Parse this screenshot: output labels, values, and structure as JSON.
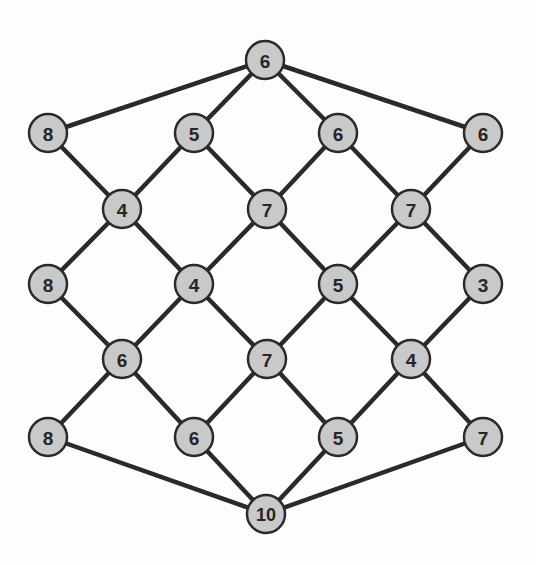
{
  "diagram": {
    "type": "lattice-graph",
    "style": {
      "node_fill": "#c9c9c9",
      "node_stroke": "#2a2a2a",
      "edge_color": "#2a2a2a",
      "background": "#fdfdfd",
      "node_radius": 19
    },
    "nodes": [
      {
        "id": "n0",
        "label": "6",
        "x": 265,
        "y": 60
      },
      {
        "id": "n1",
        "label": "8",
        "x": 48,
        "y": 133
      },
      {
        "id": "n2",
        "label": "5",
        "x": 194,
        "y": 133
      },
      {
        "id": "n3",
        "label": "6",
        "x": 338,
        "y": 133
      },
      {
        "id": "n4",
        "label": "6",
        "x": 483,
        "y": 133
      },
      {
        "id": "n5",
        "label": "4",
        "x": 122,
        "y": 209
      },
      {
        "id": "n6",
        "label": "7",
        "x": 267,
        "y": 209
      },
      {
        "id": "n7",
        "label": "7",
        "x": 411,
        "y": 209
      },
      {
        "id": "n8",
        "label": "8",
        "x": 48,
        "y": 284
      },
      {
        "id": "n9",
        "label": "4",
        "x": 194,
        "y": 284
      },
      {
        "id": "n10",
        "label": "5",
        "x": 338,
        "y": 284
      },
      {
        "id": "n11",
        "label": "3",
        "x": 483,
        "y": 284
      },
      {
        "id": "n12",
        "label": "6",
        "x": 122,
        "y": 359
      },
      {
        "id": "n13",
        "label": "7",
        "x": 267,
        "y": 359
      },
      {
        "id": "n14",
        "label": "4",
        "x": 411,
        "y": 359
      },
      {
        "id": "n15",
        "label": "8",
        "x": 48,
        "y": 437
      },
      {
        "id": "n16",
        "label": "6",
        "x": 194,
        "y": 437
      },
      {
        "id": "n17",
        "label": "5",
        "x": 338,
        "y": 437
      },
      {
        "id": "n18",
        "label": "7",
        "x": 483,
        "y": 437
      },
      {
        "id": "n19",
        "label": "10",
        "x": 266,
        "y": 514
      }
    ],
    "edges": [
      [
        "n0",
        "n1"
      ],
      [
        "n0",
        "n2"
      ],
      [
        "n0",
        "n3"
      ],
      [
        "n0",
        "n4"
      ],
      [
        "n1",
        "n5"
      ],
      [
        "n2",
        "n5"
      ],
      [
        "n2",
        "n6"
      ],
      [
        "n3",
        "n6"
      ],
      [
        "n3",
        "n7"
      ],
      [
        "n4",
        "n7"
      ],
      [
        "n5",
        "n8"
      ],
      [
        "n5",
        "n9"
      ],
      [
        "n6",
        "n9"
      ],
      [
        "n6",
        "n10"
      ],
      [
        "n7",
        "n10"
      ],
      [
        "n7",
        "n11"
      ],
      [
        "n8",
        "n12"
      ],
      [
        "n9",
        "n12"
      ],
      [
        "n9",
        "n13"
      ],
      [
        "n10",
        "n13"
      ],
      [
        "n10",
        "n14"
      ],
      [
        "n11",
        "n14"
      ],
      [
        "n12",
        "n15"
      ],
      [
        "n12",
        "n16"
      ],
      [
        "n13",
        "n16"
      ],
      [
        "n13",
        "n17"
      ],
      [
        "n14",
        "n17"
      ],
      [
        "n14",
        "n18"
      ],
      [
        "n15",
        "n19"
      ],
      [
        "n16",
        "n19"
      ],
      [
        "n17",
        "n19"
      ],
      [
        "n18",
        "n19"
      ]
    ]
  }
}
